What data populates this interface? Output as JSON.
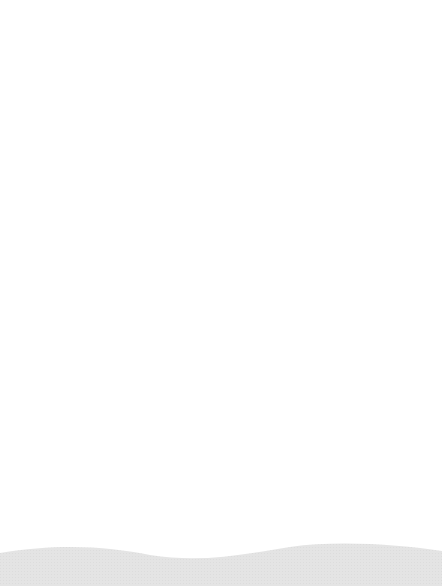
{
  "paper": {
    "type": "lined-paper",
    "line_count": 19,
    "line_color": "#a5a5a5",
    "background": "#ffffff",
    "bottom_wave_color": "#e6e6e6"
  }
}
